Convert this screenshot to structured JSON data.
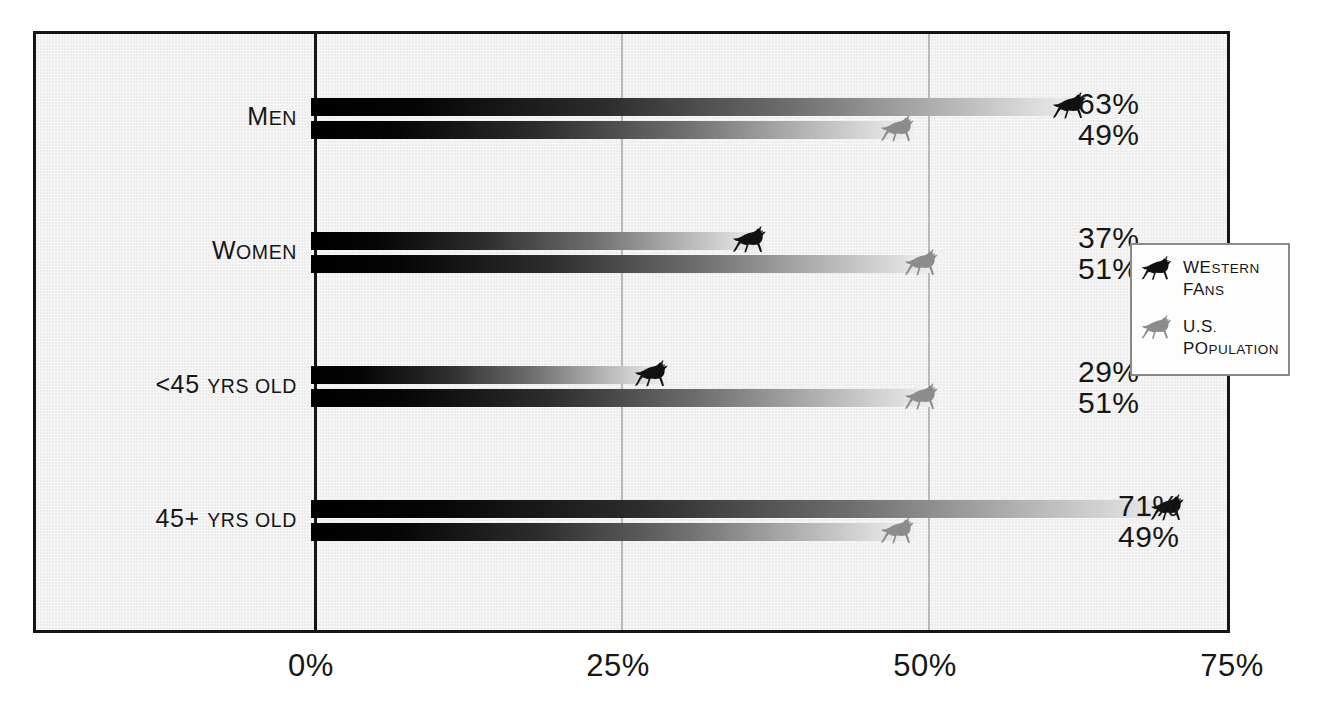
{
  "chart_data": {
    "type": "bar",
    "orientation": "horizontal",
    "title": "",
    "xlabel": "",
    "ylabel": "",
    "xlim": [
      0,
      75
    ],
    "grid": true,
    "gridlines": [
      25,
      50
    ],
    "legend_position": "right",
    "categories": [
      "Men",
      "Women",
      "<45 yrs old",
      "45+ yrs old"
    ],
    "tick_labels": [
      "0%",
      "25%",
      "50%",
      "75%"
    ],
    "tick_values": [
      0,
      25,
      50,
      75
    ],
    "series": [
      {
        "name": "Western Fans",
        "color": "#000000",
        "values": [
          63,
          37,
          29,
          71
        ],
        "value_labels": [
          "63%",
          "37%",
          "29%",
          "71%"
        ]
      },
      {
        "name": "U.S. Population",
        "color": "#7d7d7d",
        "values": [
          49,
          51,
          51,
          49
        ],
        "value_labels": [
          "49%",
          "51%",
          "51%",
          "49%"
        ]
      }
    ]
  },
  "axis": {
    "ticks": [
      {
        "label": "0%",
        "value": 0
      },
      {
        "label": "25%",
        "value": 25
      },
      {
        "label": "50%",
        "value": 50
      },
      {
        "label": "75%",
        "value": 75
      }
    ]
  },
  "categories": [
    {
      "label": "Men",
      "parts": [
        {
          "t": "M",
          "caps": true
        },
        {
          "t": "EN",
          "caps": false
        }
      ]
    },
    {
      "label": "Women",
      "parts": [
        {
          "t": "W",
          "caps": true
        },
        {
          "t": "OMEN",
          "caps": false
        }
      ]
    },
    {
      "label": "<45 yrs old",
      "parts": [
        {
          "t": "<45 ",
          "caps": true
        },
        {
          "t": "YRS OLD",
          "caps": false
        }
      ]
    },
    {
      "label": "45+ yrs old",
      "parts": [
        {
          "t": "45+ ",
          "caps": true
        },
        {
          "t": "YRS OLD",
          "caps": false
        }
      ]
    }
  ],
  "legend": {
    "items": [
      {
        "label": "Western Fans",
        "line1": "Western",
        "line2": "Fans",
        "icon": "horse-icon-black",
        "color": "#111111"
      },
      {
        "label": "U.S. Population",
        "line1": "U.S.",
        "line2": "Population",
        "icon": "horse-icon-gray",
        "color": "#8c8c8c"
      }
    ]
  },
  "colors": {
    "frame": "#151515",
    "plot_background": "#ececec",
    "gridline": "#b9b9b9",
    "text": "#161616",
    "series_western": "#000000",
    "series_population": "#7d7d7d"
  }
}
